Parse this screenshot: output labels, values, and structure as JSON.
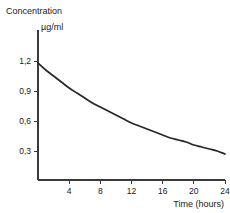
{
  "chart_data": {
    "type": "line",
    "title": "",
    "ylabel_lines": [
      "Concentration",
      "µg/ml"
    ],
    "ylabel": "Concentration µg/ml",
    "xlabel": "Time (hours)",
    "x_tick_labels": [
      "4",
      "8",
      "12",
      "16",
      "20",
      "24"
    ],
    "x_ticks": [
      4,
      8,
      12,
      16,
      20,
      24
    ],
    "y_tick_labels": [
      "0,3",
      "0,6",
      "0,9",
      "1,2"
    ],
    "y_ticks": [
      0.3,
      0.6,
      0.9,
      1.2
    ],
    "xlim": [
      0,
      24
    ],
    "ylim": [
      0,
      1.35
    ],
    "grid": false,
    "legend": false,
    "series": [
      {
        "name": "Plasma concentration",
        "color": "#262626",
        "x": [
          0,
          1,
          2,
          3,
          4,
          5,
          6,
          7,
          8,
          9,
          10,
          11,
          12,
          13,
          14,
          15,
          16,
          17,
          18,
          19,
          20,
          21,
          22,
          23,
          24
        ],
        "values": [
          1.18,
          1.11,
          1.05,
          0.99,
          0.93,
          0.88,
          0.83,
          0.78,
          0.74,
          0.7,
          0.66,
          0.62,
          0.58,
          0.55,
          0.52,
          0.49,
          0.46,
          0.43,
          0.41,
          0.39,
          0.36,
          0.34,
          0.32,
          0.3,
          0.27
        ]
      }
    ]
  },
  "colors": {
    "axis": "#3a3a3a",
    "curve": "#262626",
    "background": "#ffffff",
    "text": "#1a1a1a"
  }
}
